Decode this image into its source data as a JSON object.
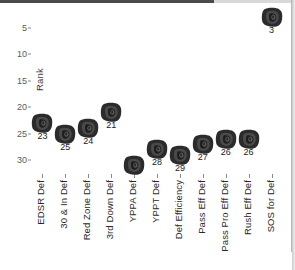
{
  "chart_data": {
    "type": "scatter",
    "title": "",
    "xlabel": "",
    "ylabel": "Rank",
    "ylim": [
      33,
      1
    ],
    "y_inverted": true,
    "yticks": [
      5,
      10,
      15,
      20,
      25,
      30
    ],
    "grid": false,
    "legend": null,
    "marker": "bulldog-logo",
    "categories": [
      "EDSR Def",
      "30 & In Def",
      "Red Zone Def",
      "3rd Down Def",
      "YPPA Def",
      "YPPT Def",
      "Def Efficiency",
      "Pass Eff Def",
      "Pass Pro Eff Def",
      "Rush Eff Def",
      "SOS for Def"
    ],
    "values": [
      23,
      25,
      24,
      21,
      31,
      28,
      29,
      27,
      26,
      26,
      3
    ],
    "point_labels": [
      "23",
      "25",
      "24",
      "21",
      "",
      "28",
      "29",
      "27",
      "26",
      "26",
      "3"
    ],
    "points": [
      {
        "category": "EDSR Def",
        "rank": 23,
        "label": "23"
      },
      {
        "category": "30 & In Def",
        "rank": 25,
        "label": "25"
      },
      {
        "category": "Red Zone Def",
        "rank": 24,
        "label": "24"
      },
      {
        "category": "3rd Down Def",
        "rank": 21,
        "label": "21"
      },
      {
        "category": "YPPA Def",
        "rank": 31,
        "label": ""
      },
      {
        "category": "YPPT Def",
        "rank": 28,
        "label": "28"
      },
      {
        "category": "Def Efficiency",
        "rank": 29,
        "label": "29"
      },
      {
        "category": "Pass Eff Def",
        "rank": 27,
        "label": "27"
      },
      {
        "category": "Pass Pro Eff Def",
        "rank": 26,
        "label": "26"
      },
      {
        "category": "Rush Eff Def",
        "rank": 26,
        "label": "26"
      },
      {
        "category": "SOS for Def",
        "rank": 3,
        "label": "3"
      }
    ],
    "colors": {
      "marker": "#2d2d2d",
      "text": "#222222",
      "axis": "#8a8a8a",
      "background": "#ffffff"
    }
  },
  "axis": {
    "y_label": "Rank",
    "y_ticks": [
      "5",
      "10",
      "15",
      "20",
      "25",
      "30"
    ]
  }
}
